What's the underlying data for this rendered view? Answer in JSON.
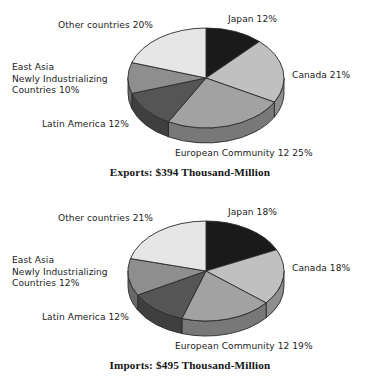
{
  "chart_data": [
    {
      "type": "pie",
      "title": "Exports: $394 Thousand-Million",
      "name": "exports",
      "unit": "percent",
      "total_label": "$394 Thousand-Million",
      "total_value": 394,
      "total_units": "Thousand-Million US dollars",
      "legend_position": "outside-labels",
      "grid": false,
      "categories": [
        "Japan",
        "Canada",
        "European Community 12",
        "Latin America",
        "East Asia Newly Industrializing Countries",
        "Other countries"
      ],
      "values": [
        12,
        21,
        25,
        12,
        10,
        20
      ],
      "labels": [
        "Japan 12%",
        "Canada 21%",
        "European Community 12 25%",
        "Latin America 12%",
        "East Asia\nNewly Industrializing\nCountries 10%",
        "Other countries 20%"
      ],
      "colors": [
        "#1a1a1a",
        "#c0c0c0",
        "#a2a2a2",
        "#555555",
        "#8e8e8e",
        "#e6e6e6"
      ]
    },
    {
      "type": "pie",
      "title": "Imports: $495 Thousand-Million",
      "name": "imports",
      "unit": "percent",
      "total_label": "$495 Thousand-Million",
      "total_value": 495,
      "total_units": "Thousand-Million US dollars",
      "legend_position": "outside-labels",
      "grid": false,
      "categories": [
        "Japan",
        "Canada",
        "European Community 12",
        "Latin America",
        "East Asia Newly Industrializing Countries",
        "Other countries"
      ],
      "values": [
        18,
        18,
        19,
        12,
        12,
        21
      ],
      "labels": [
        "Japan 18%",
        "Canada 18%",
        "European Community 12 19%",
        "Latin America 12%",
        "East Asia\nNewly Industrializing\nCountries 12%",
        "Other countries 21%"
      ],
      "colors": [
        "#1a1a1a",
        "#c0c0c0",
        "#a2a2a2",
        "#555555",
        "#8e8e8e",
        "#e6e6e6"
      ]
    }
  ],
  "exports": {
    "caption": "Exports: $394 Thousand-Million",
    "labels": {
      "japan": "Japan 12%",
      "canada": "Canada 21%",
      "european_community": "European Community 12 25%",
      "latin_america": "Latin America 12%",
      "east_asia_nic": "East Asia\nNewly Industrializing\nCountries 10%",
      "other_countries": "Other countries 20%"
    }
  },
  "imports": {
    "caption": "Imports: $495 Thousand-Million",
    "labels": {
      "japan": "Japan 18%",
      "canada": "Canada 18%",
      "european_community": "European Community 12 19%",
      "latin_america": "Latin America 12%",
      "east_asia_nic": "East Asia\nNewly Industrializing\nCountries 12%",
      "other_countries": "Other countries 21%"
    }
  },
  "palette": {
    "background": "#ffffff",
    "text": "#1d1d1d",
    "outline": "#2a2a2a",
    "slice_japan": "#1a1a1a",
    "slice_canada": "#c0c0c0",
    "slice_european_community": "#a2a2a2",
    "slice_latin_america": "#555555",
    "slice_east_asia_nic": "#8e8e8e",
    "slice_other_countries": "#e6e6e6"
  }
}
